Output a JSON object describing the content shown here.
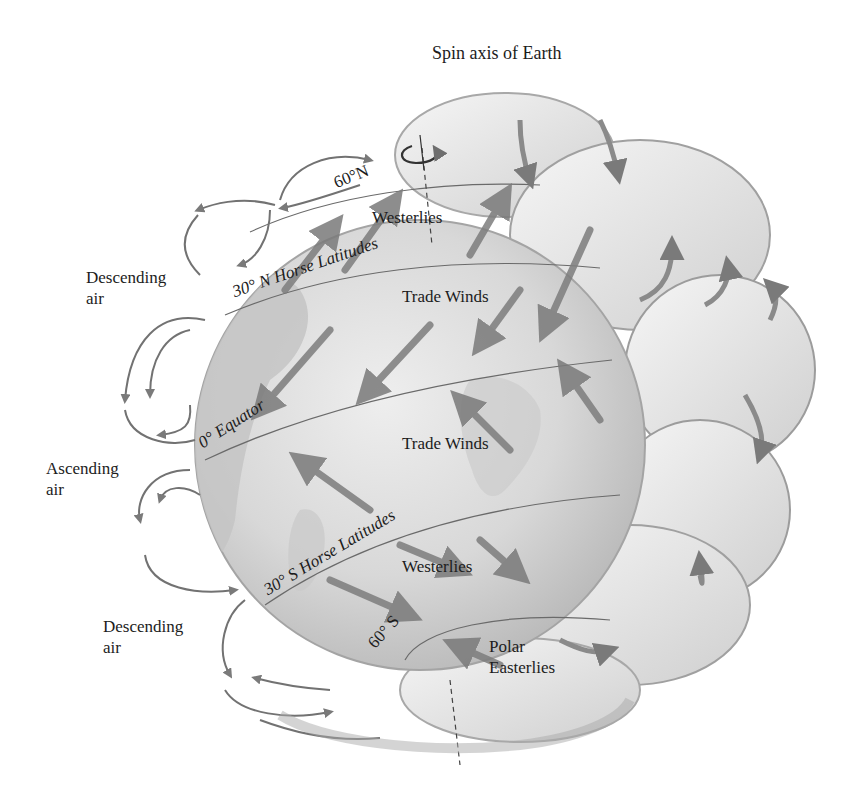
{
  "diagram": {
    "axis_label": "Spin axis of Earth",
    "side_labels": {
      "descending_top": [
        "Descending",
        "air"
      ],
      "ascending": [
        "Ascending",
        "air"
      ],
      "descending_bottom": [
        "Descending",
        "air"
      ]
    },
    "latitudes": {
      "n60": "60°N",
      "n30": "30° N Horse Latitudes",
      "equator": "0° Equator",
      "s30": "30° S Horse Latitudes",
      "s60": "60° S"
    },
    "wind_belts": {
      "westerlies_north": "Westerlies",
      "trade_winds_north": "Trade Winds",
      "trade_winds_south": "Trade Winds",
      "westerlies_south": "Westerlies",
      "polar_easterlies": [
        "Polar",
        "Easterlies"
      ]
    },
    "colors": {
      "globe_fill": "#d6d6d6",
      "globe_shade": "#bdbdbd",
      "cell_fill": "#ececec",
      "cell_edge": "#9a9a9a",
      "arrow": "#7d7d7d",
      "line": "#6a6a6a",
      "text": "#1c1c1c"
    }
  }
}
